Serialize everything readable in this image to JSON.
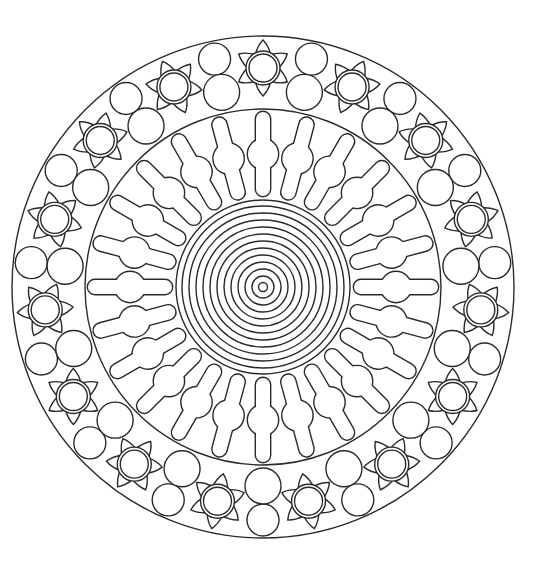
{
  "image": {
    "kind": "mandala coloring page",
    "width": 540,
    "height": 572,
    "background": "#ffffff",
    "line_color": "#2a2a2a"
  },
  "mandala": {
    "center": [
      263,
      287
    ],
    "outer_circle_radius": 251,
    "inner_ring_radius": 178,
    "concentric_core": {
      "count": 13,
      "radii": [
        4.5,
        11,
        18,
        25,
        32,
        39,
        46,
        53,
        60,
        67,
        74,
        81,
        87
      ]
    },
    "spokes": {
      "count": 24,
      "angle_step_deg": 15,
      "inner_r": 91,
      "outer_r": 175,
      "half_width": 7,
      "bulge_r_pos": 133,
      "bulge_radius": 15
    },
    "flowers": {
      "count": 15,
      "angle_step_deg": 24,
      "start_angle_deg": 0,
      "ring_r": 219,
      "outer_circle_radius": 17,
      "inner_circle_radius": 14,
      "petal_count": 6,
      "petal_tip_r": 28,
      "petal_half_angle_deg": 20
    },
    "ring_circles": {
      "angle_offset_deg": 12,
      "angle_step_deg": 24,
      "outer": {
        "ring_r": 233,
        "radius": 16
      },
      "inner": {
        "ring_r": 199,
        "radius": 18
      }
    }
  }
}
